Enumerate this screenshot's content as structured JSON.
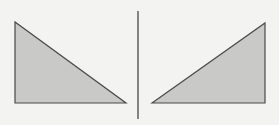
{
  "diagram": {
    "background": "#f3f3f1",
    "fill": "#c9c9c7",
    "stroke": "#4a4a4a",
    "divider": {
      "x": 138,
      "y1": 11,
      "y2": 119,
      "color": "#3a3a3a"
    },
    "left_triangle": {
      "points": "15,22 15,103 126,103",
      "description": "right triangle, right angle at bottom-left"
    },
    "right_triangle": {
      "points": "152,103 265,23 265,103",
      "description": "right triangle, right angle at bottom-right"
    }
  }
}
